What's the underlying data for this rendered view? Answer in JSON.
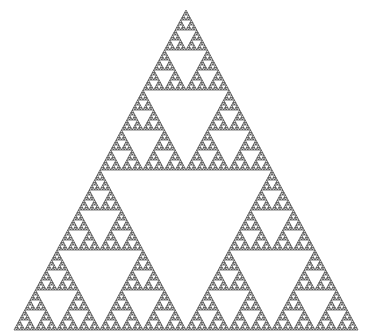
{
  "figure": {
    "background_color": "#ffffff",
    "stroke_color": "#3a3a3a",
    "fill_color": "#ffffff",
    "outer_triangle": {
      "apex": [
        186,
        10
      ],
      "base_left": [
        14,
        330
      ],
      "base_right": [
        358,
        330
      ]
    },
    "recursion_depth": 7
  }
}
